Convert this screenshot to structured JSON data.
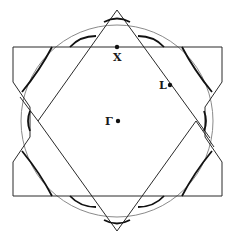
{
  "diagram": {
    "title": "",
    "colors": {
      "outline": "#2a2a2a",
      "circle": "#888888",
      "fermi_contour": "#111111",
      "point": "#111111",
      "background": "#ffffff"
    },
    "points": [
      {
        "id": "X",
        "label": "X",
        "x": 117,
        "y": 47
      },
      {
        "id": "L",
        "label": "L",
        "x": 170,
        "y": 85
      },
      {
        "id": "Gamma",
        "label": "Γ",
        "x": 118,
        "y": 121
      }
    ],
    "shapes": {
      "zone_boundary": "truncated-square (octagonal) outline",
      "triangles": [
        "upward triangle",
        "downward triangle"
      ],
      "free_electron_sphere": "circle"
    }
  }
}
